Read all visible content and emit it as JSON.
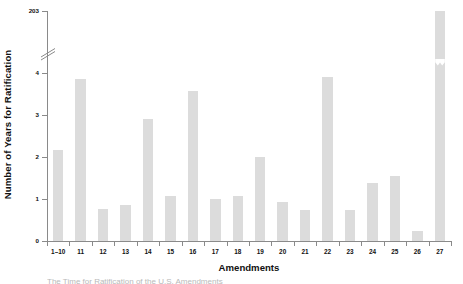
{
  "chart_data": {
    "type": "bar",
    "title": "",
    "xlabel": "Amendments",
    "ylabel": "Number of Years for Ratification",
    "categories": [
      "1–10",
      "11",
      "12",
      "13",
      "14",
      "15",
      "16",
      "17",
      "18",
      "19",
      "20",
      "21",
      "22",
      "23",
      "24",
      "25",
      "26",
      "27"
    ],
    "values": [
      2.17,
      3.85,
      0.77,
      0.85,
      2.9,
      1.08,
      3.57,
      1.0,
      1.07,
      2.0,
      0.92,
      0.75,
      3.9,
      0.75,
      1.38,
      1.55,
      0.25,
      203
    ],
    "bar_color": "#dcdcdc",
    "axis_color": "#8a8a8a",
    "grid": false,
    "legend": false,
    "ylim": [
      0,
      4
    ],
    "yticks": [
      "0",
      "1",
      "2",
      "3",
      "4",
      "203"
    ],
    "ytick_values": [
      0,
      1,
      2,
      3,
      4,
      203
    ],
    "y_axis_break": {
      "between": [
        4,
        203
      ],
      "note": "broken y axis — scale jumps from 4 to 203"
    },
    "annotations": [
      "Bar for amendment 27 is truncated with a break mark; its true value is 203 years."
    ]
  },
  "figure": {
    "caption_partial": "The Time for Ratification of the U.S. Amendments"
  }
}
